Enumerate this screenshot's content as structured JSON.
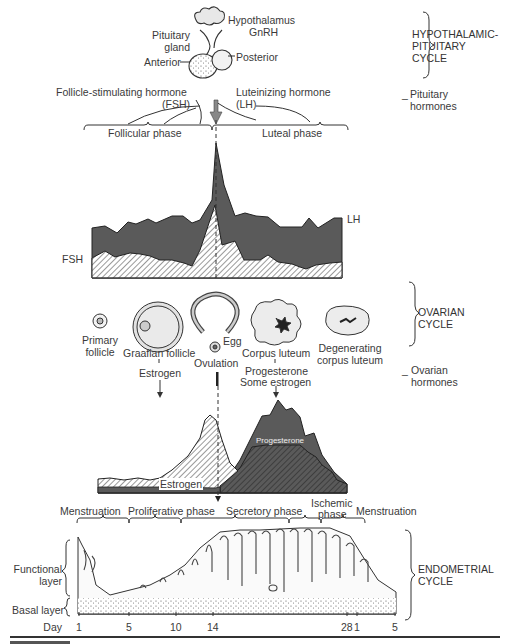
{
  "hypothalamic": {
    "hypothalamus": "Hypothalamus",
    "gnrh": "GnRH",
    "pituitary_gland": "Pituitary\ngland",
    "pituitary_line1": "Pituitary",
    "pituitary_line2": "gland",
    "anterior": "Anterior",
    "posterior": "Posterior",
    "cycle_line1": "HYPOTHALAMIC-",
    "cycle_line2": "PITUITARY",
    "cycle_line3": "CYCLE"
  },
  "pituitary_hormones": {
    "fsh_line1": "Follicle-stimulating hormone",
    "fsh_line2": "(FSH)",
    "lh_line1": "Luteinizing hormone",
    "lh_line2": "(LH)",
    "side_line1": "Pituitary",
    "side_line2": "hormones",
    "follicular_phase": "Follicular phase",
    "luteal_phase": "Luteal phase",
    "lh_label": "LH",
    "fsh_label": "FSH"
  },
  "ovarian": {
    "primary_follicle_1": "Primary",
    "primary_follicle_2": "follicle",
    "graafian_follicle": "Graafian follicle",
    "estrogen": "Estrogen",
    "egg": "Egg",
    "ovulation": "Ovulation",
    "corpus_luteum": "Corpus luteum",
    "progesterone": "Progesterone",
    "some_estrogen": "Some estrogen",
    "degenerating_1": "Degenerating",
    "degenerating_2": "corpus luteum",
    "cycle_line1": "OVARIAN",
    "cycle_line2": "CYCLE",
    "side_line1": "Ovarian",
    "side_line2": "hormones",
    "estrogen_curve_label": "Estrogen",
    "progesterone_curve_label": "Progesterone"
  },
  "endometrial": {
    "phases": [
      "Menstruation",
      "Proliferative phase",
      "Secretory phase",
      "Ischemic",
      "phase",
      "Menstruation"
    ],
    "functional_layer_1": "Functional",
    "functional_layer_2": "layer",
    "basal_layer": "Basal layer",
    "cycle_line1": "ENDOMETRIAL",
    "cycle_line2": "CYCLE",
    "day_label": "Day",
    "days": [
      "1",
      "5",
      "10",
      "14",
      "28",
      "1",
      "5"
    ]
  },
  "colors": {
    "dark_fill": "#5c5c5c",
    "hatch": "#555555",
    "line": "#222222",
    "text": "#3a3a3a"
  }
}
